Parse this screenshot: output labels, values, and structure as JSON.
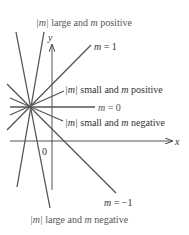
{
  "figure": {
    "colors": {
      "line": "#555555",
      "axis": "#555555",
      "label": "#555555"
    },
    "axes": {
      "x_label": "x",
      "y_label": "y",
      "origin_label": "0"
    },
    "labels": {
      "large_positive": {
        "bar_m": "|m|",
        "rest": " large and ",
        "m": "m",
        "tail": " positive"
      },
      "m_one": {
        "m": "m",
        "rest": " = 1"
      },
      "small_positive": {
        "bar_m": "|m|",
        "rest": " small and ",
        "m": "m",
        "tail": " positive"
      },
      "m_zero": {
        "m": "m",
        "rest": " = 0"
      },
      "small_negative": {
        "bar_m": "|m|",
        "rest": " small and ",
        "m": "m",
        "tail": " negative"
      },
      "m_neg_one": {
        "m": "m",
        "rest": " = −1"
      },
      "large_negative": {
        "bar_m": "|m|",
        "rest": " large and ",
        "m": "m",
        "tail": " negative"
      }
    },
    "lines": [
      {
        "name": "m=1",
        "slope_desc": "1"
      },
      {
        "name": "m=-1",
        "slope_desc": "-1"
      },
      {
        "name": "m=0",
        "slope_desc": "0"
      },
      {
        "name": "small-positive",
        "slope_desc": "small positive"
      },
      {
        "name": "small-negative",
        "slope_desc": "small negative"
      },
      {
        "name": "large-positive",
        "slope_desc": "large positive"
      },
      {
        "name": "large-negative",
        "slope_desc": "large negative"
      }
    ]
  }
}
